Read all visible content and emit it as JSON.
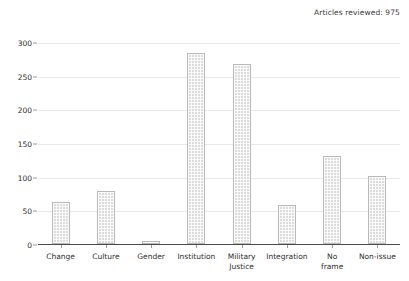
{
  "annotation": {
    "text": "Articles reviewed: 975"
  },
  "chart_data": {
    "type": "bar",
    "title": "",
    "subtitle": "",
    "xlabel": "",
    "ylabel": "",
    "categories": [
      "Change",
      "Culture",
      "Gender",
      "Institution",
      "Military Justice",
      "Integration",
      "No frame",
      "Non-issue"
    ],
    "category_lines": [
      [
        "Change"
      ],
      [
        "Culture"
      ],
      [
        "Gender"
      ],
      [
        "Institution"
      ],
      [
        "Military",
        "Justice"
      ],
      [
        "Integration"
      ],
      [
        "No",
        "frame"
      ],
      [
        "Non-issue"
      ]
    ],
    "values": [
      62,
      78,
      4,
      283,
      268,
      58,
      130,
      101
    ],
    "ylim": [
      0,
      300
    ],
    "yticks": [
      0,
      50,
      100,
      150,
      200,
      250,
      300
    ],
    "ytick_labels": [
      "0",
      "50",
      "100",
      "150",
      "200",
      "250",
      "300"
    ],
    "grid": true,
    "legend": "none",
    "annotations": [
      "Articles reviewed: 975"
    ],
    "bar_fill_color": "#dcdcdc",
    "bar_edge_color": "#b9b9b9",
    "gridline_color": "#e9e9e9",
    "axis_color": "#4a4a4a",
    "text_color": "#2e2e2e"
  }
}
